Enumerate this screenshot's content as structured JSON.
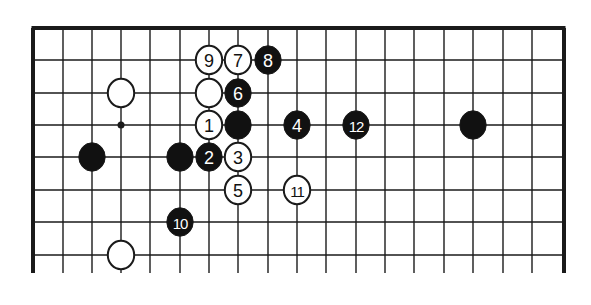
{
  "diagram": {
    "type": "go-board-partial",
    "colors": {
      "line": "#1a1a1a",
      "black_stone": "#111111",
      "white_stone": "#ffffff",
      "background": "#ffffff"
    },
    "grid": {
      "col_x": [
        33,
        63,
        92,
        121,
        150,
        180,
        209,
        238,
        268,
        297,
        326,
        356,
        385,
        414,
        444,
        473,
        503,
        532,
        564
      ],
      "row_y": [
        28,
        60,
        93,
        125,
        157,
        190,
        222,
        255
      ],
      "line_bottom": 273,
      "edges": {
        "top": true,
        "left": true,
        "right": true,
        "bottom": false
      }
    },
    "hoshi": [
      {
        "col": 3,
        "row": 3
      }
    ],
    "stones": [
      {
        "color": "white",
        "col": 3,
        "row": 2,
        "label": ""
      },
      {
        "color": "white",
        "col": 3,
        "row": 7,
        "label": ""
      },
      {
        "color": "black",
        "col": 2,
        "row": 4,
        "label": ""
      },
      {
        "color": "black",
        "col": 5,
        "row": 4,
        "label": ""
      },
      {
        "color": "black",
        "col": 7,
        "row": 3,
        "label": ""
      },
      {
        "color": "black",
        "col": 15,
        "row": 3,
        "label": ""
      },
      {
        "color": "white",
        "col": 6,
        "row": 2,
        "label": ""
      },
      {
        "color": "white",
        "col": 6,
        "row": 3,
        "label": "1"
      },
      {
        "color": "black",
        "col": 6,
        "row": 4,
        "label": "2"
      },
      {
        "color": "white",
        "col": 7,
        "row": 4,
        "label": "3"
      },
      {
        "color": "black",
        "col": 9,
        "row": 3,
        "label": "4"
      },
      {
        "color": "white",
        "col": 7,
        "row": 5,
        "label": "5"
      },
      {
        "color": "black",
        "col": 7,
        "row": 2,
        "label": "6"
      },
      {
        "color": "white",
        "col": 7,
        "row": 1,
        "label": "7"
      },
      {
        "color": "black",
        "col": 8,
        "row": 1,
        "label": "8"
      },
      {
        "color": "white",
        "col": 6,
        "row": 1,
        "label": "9"
      },
      {
        "color": "black",
        "col": 5,
        "row": 6,
        "label": "10"
      },
      {
        "color": "white",
        "col": 9,
        "row": 5,
        "label": "11"
      },
      {
        "color": "black",
        "col": 11,
        "row": 3,
        "label": "12"
      }
    ]
  }
}
